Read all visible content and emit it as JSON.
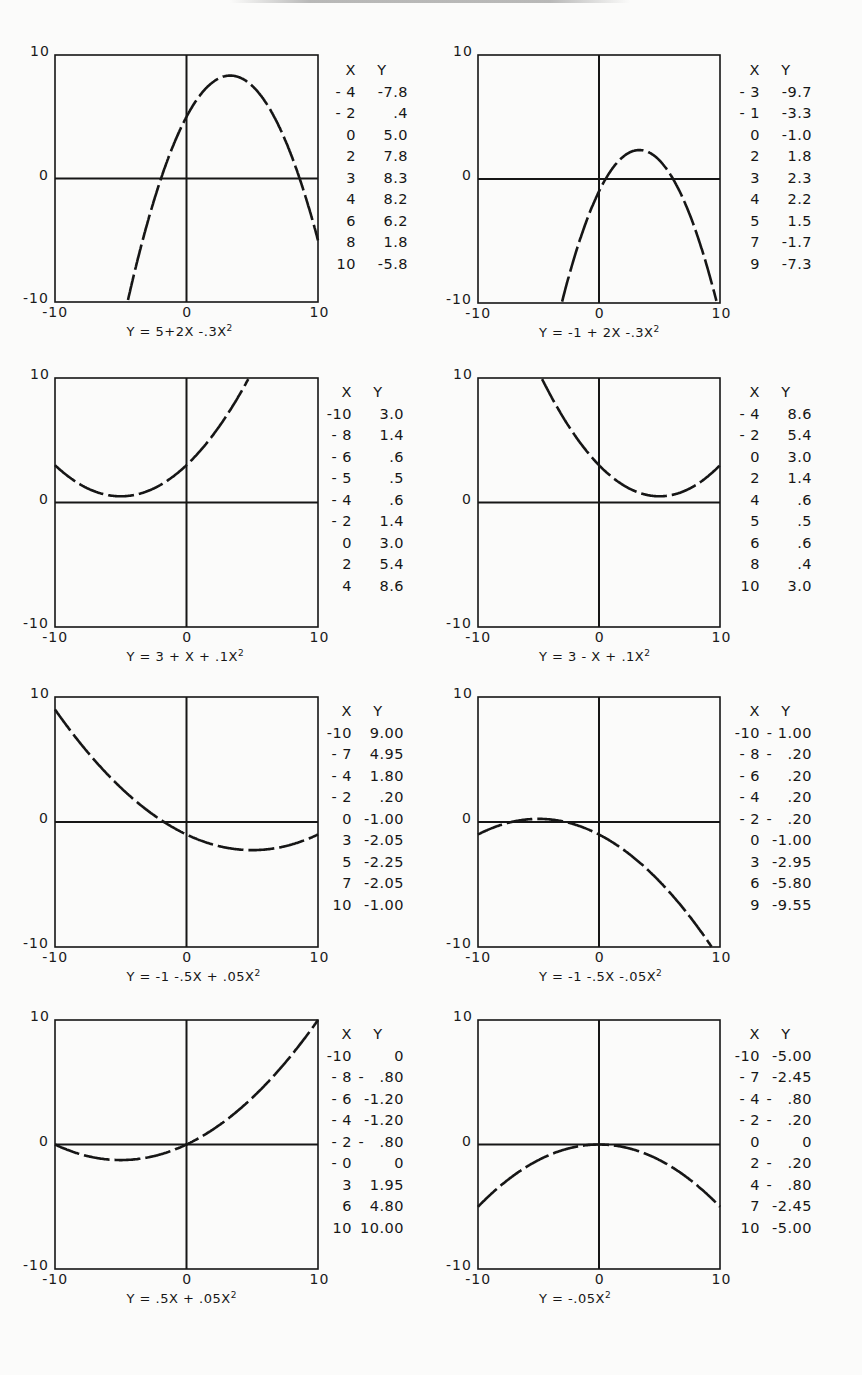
{
  "page": {
    "top_text_fragment": "(cut-off heading text at top edge, illegible)"
  },
  "chart_data": [
    {
      "type": "line",
      "title": "Y = 5+2X -.3X²",
      "caption_main": "Y = 5+2X -.3X",
      "caption_exp": "2",
      "xlim": [
        -10,
        10
      ],
      "ylim": [
        -10,
        10
      ],
      "x_ticks": [
        "-10",
        "0",
        "10"
      ],
      "y_ticks": [
        "10",
        "0",
        "-10"
      ],
      "coeffs": {
        "a": 5,
        "b": 2,
        "c": -0.3
      },
      "table_header": [
        "X",
        "Y"
      ],
      "table": [
        [
          "- 4",
          "-7.8"
        ],
        [
          "- 2",
          ".4"
        ],
        [
          "0",
          "5.0"
        ],
        [
          "2",
          "7.8"
        ],
        [
          "3",
          "8.3"
        ],
        [
          "4",
          "8.2"
        ],
        [
          "6",
          "6.2"
        ],
        [
          "8",
          "1.8"
        ],
        [
          "10",
          "-5.8"
        ]
      ],
      "x": [
        -4,
        -2,
        0,
        2,
        3,
        4,
        6,
        8,
        10
      ],
      "y": [
        -7.8,
        0.4,
        5.0,
        7.8,
        8.3,
        8.2,
        6.2,
        1.8,
        -5.8
      ],
      "grid": false,
      "style": "dashed curve, axes through origin"
    },
    {
      "type": "line",
      "title": "Y = -1+2X -.3X²",
      "caption_main": "Y = -1 + 2X -.3X",
      "caption_exp": "2",
      "xlim": [
        -10,
        10
      ],
      "ylim": [
        -10,
        10
      ],
      "x_ticks": [
        "-10",
        "0",
        "10"
      ],
      "y_ticks": [
        "10",
        "0",
        "-10"
      ],
      "coeffs": {
        "a": -1,
        "b": 2,
        "c": -0.3
      },
      "table_header": [
        "X",
        "Y"
      ],
      "table": [
        [
          "- 3",
          "-9.7"
        ],
        [
          "- 1",
          "-3.3"
        ],
        [
          "0",
          "-1.0"
        ],
        [
          "2",
          "1.8"
        ],
        [
          "3",
          "2.3"
        ],
        [
          "4",
          "2.2"
        ],
        [
          "5",
          "1.5"
        ],
        [
          "7",
          "-1.7"
        ],
        [
          "9",
          "-7.3"
        ]
      ],
      "x": [
        -3,
        -1,
        0,
        2,
        3,
        4,
        5,
        7,
        9
      ],
      "y": [
        -9.7,
        -3.3,
        -1.0,
        1.8,
        2.3,
        2.2,
        1.5,
        -1.7,
        -7.3
      ],
      "grid": false,
      "style": "dashed curve, axes through origin"
    },
    {
      "type": "line",
      "title": "Y = 3 + X + .1X²",
      "caption_main": "Y = 3 + X + .1X",
      "caption_exp": "2",
      "xlim": [
        -10,
        10
      ],
      "ylim": [
        -10,
        10
      ],
      "x_ticks": [
        "-10",
        "0",
        "10"
      ],
      "y_ticks": [
        "10",
        "0",
        "-10"
      ],
      "coeffs": {
        "a": 3,
        "b": 1,
        "c": 0.1
      },
      "table_header": [
        "X",
        "Y"
      ],
      "table": [
        [
          "-10",
          "3.0"
        ],
        [
          "- 8",
          "1.4"
        ],
        [
          "- 6",
          ".6"
        ],
        [
          "- 5",
          ".5"
        ],
        [
          "- 4",
          ".6"
        ],
        [
          "- 2",
          "1.4"
        ],
        [
          "0",
          "3.0"
        ],
        [
          "2",
          "5.4"
        ],
        [
          "4",
          "8.6"
        ]
      ],
      "x": [
        -10,
        -8,
        -6,
        -5,
        -4,
        -2,
        0,
        2,
        4
      ],
      "y": [
        3.0,
        1.4,
        0.6,
        0.5,
        0.6,
        1.4,
        3.0,
        5.4,
        8.6
      ],
      "grid": false,
      "style": "dashed curve, axes through origin"
    },
    {
      "type": "line",
      "title": "Y = 3 - X + .1X²",
      "caption_main": "Y = 3 - X + .1X",
      "caption_exp": "2",
      "xlim": [
        -10,
        10
      ],
      "ylim": [
        -10,
        10
      ],
      "x_ticks": [
        "-10",
        "0",
        "10"
      ],
      "y_ticks": [
        "10",
        "0",
        "-10"
      ],
      "coeffs": {
        "a": 3,
        "b": -1,
        "c": 0.1
      },
      "table_header": [
        "X",
        "Y"
      ],
      "table": [
        [
          "- 4",
          "8.6"
        ],
        [
          "- 2",
          "5.4"
        ],
        [
          "0",
          "3.0"
        ],
        [
          "2",
          "1.4"
        ],
        [
          "4",
          ".6"
        ],
        [
          "5",
          ".5"
        ],
        [
          "6",
          ".6"
        ],
        [
          "8",
          ".4"
        ],
        [
          "10",
          "3.0"
        ]
      ],
      "x": [
        -4,
        -2,
        0,
        2,
        4,
        5,
        6,
        8,
        10
      ],
      "y": [
        8.6,
        5.4,
        3.0,
        1.4,
        0.6,
        0.5,
        0.6,
        0.4,
        3.0
      ],
      "grid": false,
      "style": "dashed curve, axes through origin"
    },
    {
      "type": "line",
      "title": "Y = -1 -.5X + .05X²",
      "caption_main": "Y = -1 -.5X + .05X",
      "caption_exp": "2",
      "xlim": [
        -10,
        10
      ],
      "ylim": [
        -10,
        10
      ],
      "x_ticks": [
        "-10",
        "0",
        "10"
      ],
      "y_ticks": [
        "10",
        "0",
        "-10"
      ],
      "coeffs": {
        "a": -1,
        "b": -0.5,
        "c": 0.05
      },
      "table_header": [
        "X",
        "Y"
      ],
      "table": [
        [
          "-10",
          "9.00"
        ],
        [
          "- 7",
          "4.95"
        ],
        [
          "- 4",
          "1.80"
        ],
        [
          "- 2",
          ".20"
        ],
        [
          "0",
          "-1.00"
        ],
        [
          "3",
          "-2.05"
        ],
        [
          "5",
          "-2.25"
        ],
        [
          "7",
          "-2.05"
        ],
        [
          "10",
          "-1.00"
        ]
      ],
      "x": [
        -10,
        -7,
        -4,
        -2,
        0,
        3,
        5,
        7,
        10
      ],
      "y": [
        9.0,
        4.95,
        1.8,
        0.2,
        -1.0,
        -2.05,
        -2.25,
        -2.05,
        -1.0
      ],
      "grid": false,
      "style": "dashed curve, axes through origin"
    },
    {
      "type": "line",
      "title": "Y = -1 -.5X -.05X²",
      "caption_main": "Y = -1 -.5X -.05X",
      "caption_exp": "2",
      "xlim": [
        -10,
        10
      ],
      "ylim": [
        -10,
        10
      ],
      "x_ticks": [
        "-10",
        "0",
        "10"
      ],
      "y_ticks": [
        "10",
        "0",
        "-10"
      ],
      "coeffs": {
        "a": -1,
        "b": -0.5,
        "c": -0.05
      },
      "table_header": [
        "X",
        "Y"
      ],
      "table": [
        [
          "-10",
          "- 1.00"
        ],
        [
          "- 8",
          "-   .20"
        ],
        [
          "- 6",
          ".20"
        ],
        [
          "- 4",
          ".20"
        ],
        [
          "- 2",
          "-   .20"
        ],
        [
          "0",
          "-1.00"
        ],
        [
          "3",
          "-2.95"
        ],
        [
          "6",
          "-5.80"
        ],
        [
          "9",
          "-9.55"
        ]
      ],
      "x": [
        -10,
        -8,
        -6,
        -4,
        -2,
        0,
        3,
        6,
        9
      ],
      "y": [
        -1.0,
        -0.2,
        0.2,
        0.2,
        -0.2,
        -1.0,
        -2.95,
        -5.8,
        -9.55
      ],
      "grid": false,
      "style": "dashed curve, axes through origin"
    },
    {
      "type": "line",
      "title": "Y = .5X + .05X²",
      "caption_main": "Y = .5X + .05X",
      "caption_exp": "2",
      "xlim": [
        -10,
        10
      ],
      "ylim": [
        -10,
        10
      ],
      "x_ticks": [
        "-10",
        "0",
        "10"
      ],
      "y_ticks": [
        "10",
        "0",
        "-10"
      ],
      "coeffs": {
        "a": 0,
        "b": 0.5,
        "c": 0.05
      },
      "table_header": [
        "X",
        "Y"
      ],
      "table": [
        [
          "-10",
          "0"
        ],
        [
          "- 8",
          "-   .80"
        ],
        [
          "- 6",
          "-1.20"
        ],
        [
          "- 4",
          "-1.20"
        ],
        [
          "- 2",
          "-   .80"
        ],
        [
          "- 0",
          "0"
        ],
        [
          "3",
          "1.95"
        ],
        [
          "6",
          "4.80"
        ],
        [
          "10",
          "10.00"
        ]
      ],
      "x": [
        -10,
        -8,
        -6,
        -4,
        -2,
        0,
        3,
        6,
        10
      ],
      "y": [
        0,
        -0.8,
        -1.2,
        -1.2,
        -0.8,
        0,
        1.95,
        4.8,
        10.0
      ],
      "grid": false,
      "style": "dashed curve, axes through origin"
    },
    {
      "type": "line",
      "title": "Y = -.05X²",
      "caption_main": "Y = -.05X",
      "caption_exp": "2",
      "xlim": [
        -10,
        10
      ],
      "ylim": [
        -10,
        10
      ],
      "x_ticks": [
        "-10",
        "0",
        "10"
      ],
      "y_ticks": [
        "10",
        "0",
        "-10"
      ],
      "coeffs": {
        "a": 0,
        "b": 0,
        "c": -0.05
      },
      "table_header": [
        "X",
        "Y"
      ],
      "table": [
        [
          "-10",
          "-5.00"
        ],
        [
          "- 7",
          "-2.45"
        ],
        [
          "- 4",
          "-   .80"
        ],
        [
          "- 2",
          "-   .20"
        ],
        [
          "0",
          "0"
        ],
        [
          "2",
          "-   .20"
        ],
        [
          "4",
          "-   .80"
        ],
        [
          "7",
          "-2.45"
        ],
        [
          "10",
          "-5.00"
        ]
      ],
      "x": [
        -10,
        -7,
        -4,
        -2,
        0,
        2,
        4,
        7,
        10
      ],
      "y": [
        -5.0,
        -2.45,
        -0.8,
        -0.2,
        0,
        -0.2,
        -0.8,
        -2.45,
        -5.0
      ],
      "grid": false,
      "style": "dashed curve, axes through origin"
    }
  ],
  "colors": {
    "ink": "#161616",
    "paper": "#fbfbfa"
  }
}
